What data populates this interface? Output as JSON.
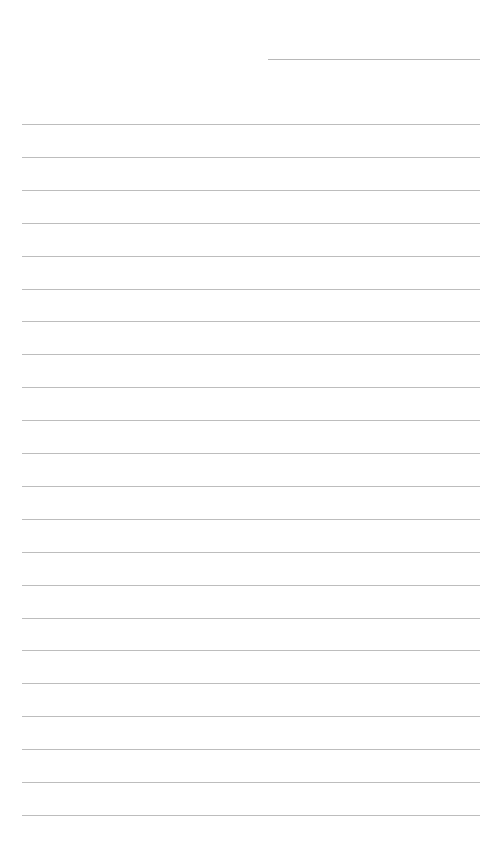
{
  "page": {
    "type": "lined-paper",
    "background_color": "#ffffff",
    "line_color": "#bdbdbd",
    "header_line": {
      "present": true,
      "label": ""
    },
    "rule_count": 22,
    "rules": [
      {
        "text": ""
      },
      {
        "text": ""
      },
      {
        "text": ""
      },
      {
        "text": ""
      },
      {
        "text": ""
      },
      {
        "text": ""
      },
      {
        "text": ""
      },
      {
        "text": ""
      },
      {
        "text": ""
      },
      {
        "text": ""
      },
      {
        "text": ""
      },
      {
        "text": ""
      },
      {
        "text": ""
      },
      {
        "text": ""
      },
      {
        "text": ""
      },
      {
        "text": ""
      },
      {
        "text": ""
      },
      {
        "text": ""
      },
      {
        "text": ""
      },
      {
        "text": ""
      },
      {
        "text": ""
      },
      {
        "text": ""
      }
    ]
  }
}
